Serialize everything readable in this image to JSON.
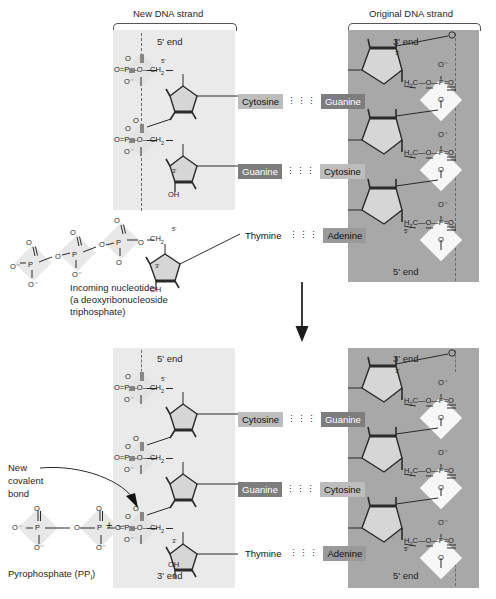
{
  "figure": {
    "title_new_strand": "New DNA strand",
    "title_original_strand": "Original DNA strand"
  },
  "colors": {
    "panel_new": "#eaeaea",
    "panel_original": "#a8a8a8",
    "base_cytosine": "#bdbdbd",
    "base_guanine": "#7d7d7d",
    "base_thymine": "#f0f0f0",
    "base_adenine": "#9a9a9a",
    "phosphate_diamond_light": "#e3e3e3",
    "phosphate_diamond_white": "#f7f7f7",
    "stroke": "#333333",
    "background": "#ffffff"
  },
  "top_panel": {
    "new_strand": {
      "end_top": "5ʹ end",
      "sugar_marks": [
        "5ʹ",
        "3ʹ"
      ],
      "hydroxyl": "OH",
      "phosphate_groups": [
        {
          "formula": "O=P—O—CH",
          "sub": "2",
          "top_atom": "O",
          "bottom_atom": "O⁻"
        },
        {
          "formula": "O=P—O—CH",
          "sub": "2",
          "top_atom": "O",
          "bottom_atom": "O⁻"
        }
      ]
    },
    "original_strand": {
      "end_top": "3ʹ end",
      "end_bottom": "5ʹ end",
      "sugar_marks": [
        "3ʹ",
        "5ʹ"
      ],
      "phosphate_groups": [
        {
          "prefix": "H",
          "prefix_sub": "2",
          "formula": "C—O—P=O",
          "top_atom": "O⁻",
          "bottom_atom": "O"
        },
        {
          "prefix": "H",
          "prefix_sub": "2",
          "formula": "C—O—P=O",
          "top_atom": "O⁻",
          "bottom_atom": "O"
        },
        {
          "prefix": "H",
          "prefix_sub": "2",
          "formula": "C—O—P=O",
          "top_atom": "O⁻",
          "bottom_atom": "O"
        }
      ]
    },
    "base_pairs": [
      {
        "left": "Cytosine",
        "left_style": "b-cyt",
        "bond": "⋮⋮⋮",
        "right": "Guanine",
        "right_style": "b-gua"
      },
      {
        "left": "Guanine",
        "left_style": "b-gua",
        "bond": "⋮⋮⋮",
        "right": "Cytosine",
        "right_style": "b-cyt"
      },
      {
        "left": "Thymine",
        "left_style": "b-plain",
        "bond": "⋮⋮⋮",
        "right": "Adenine",
        "right_style": "b-ade"
      }
    ]
  },
  "incoming_nucleotide": {
    "caption_line1": "Incoming nucleotide",
    "caption_line2": "(a deoxyribonucleoside",
    "caption_line3": "triphosphate)",
    "sugar_marks": [
      "5ʹ",
      "3ʹ"
    ],
    "hydroxyl": "OH",
    "methylene": "CH",
    "methylene_sub": "2",
    "phosphates": [
      {
        "top_atom": "O",
        "left_atom": "O⁻",
        "bottom_atom": "O⁻",
        "label": "P"
      },
      {
        "top_atom": "O",
        "bottom_atom": "O⁻",
        "label": "P"
      },
      {
        "top_atom": "O",
        "bottom_atom": "O",
        "label": "P"
      }
    ]
  },
  "bottom_panel": {
    "new_strand": {
      "end_top": "5ʹ end",
      "end_bottom": "3ʹ end",
      "sugar_marks": [
        "5ʹ",
        "3ʹ"
      ],
      "hydroxyl": "OH",
      "phosphate_groups": [
        {
          "formula": "O=P—O—CH",
          "sub": "2",
          "top_atom": "O",
          "bottom_atom": "O⁻"
        },
        {
          "formula": "O=P—O—CH",
          "sub": "2",
          "top_atom": "O",
          "bottom_atom": "O⁻"
        },
        {
          "formula": "O=P—O—CH",
          "sub": "2",
          "top_atom": "O",
          "bottom_atom": "O⁻"
        }
      ]
    },
    "original_strand": {
      "end_top": "3ʹ end",
      "end_bottom": "5ʹ end",
      "sugar_marks": [
        "3ʹ",
        "5ʹ"
      ]
    },
    "base_pairs": [
      {
        "left": "Cytosine",
        "left_style": "b-cyt",
        "bond": "⋮⋮⋮",
        "right": "Guanine",
        "right_style": "b-gua"
      },
      {
        "left": "Guanine",
        "left_style": "b-gua",
        "bond": "⋮⋮⋮",
        "right": "Cytosine",
        "right_style": "b-cyt"
      },
      {
        "left": "Thymine",
        "left_style": "b-plain",
        "bond": "⋮⋮⋮",
        "right": "Adenine",
        "right_style": "b-ade"
      }
    ]
  },
  "annotations": {
    "new_covalent_bond_line1": "New",
    "new_covalent_bond_line2": "covalent",
    "new_covalent_bond_line3": "bond",
    "plus_sign": "+",
    "pyrophosphate_caption": "Pyrophosphate (PP",
    "pyrophosphate_sub": "i",
    "pyrophosphate_caption_end": ")"
  },
  "pyrophosphate": {
    "phosphates": [
      {
        "top_atom": "O",
        "left_atom": "O⁻",
        "bottom_atom": "O⁻",
        "label": "P"
      },
      {
        "top_atom": "O",
        "left_atom": "O",
        "right_atom": "O⁻",
        "bottom_atom": "O⁻",
        "label": "P"
      }
    ]
  }
}
